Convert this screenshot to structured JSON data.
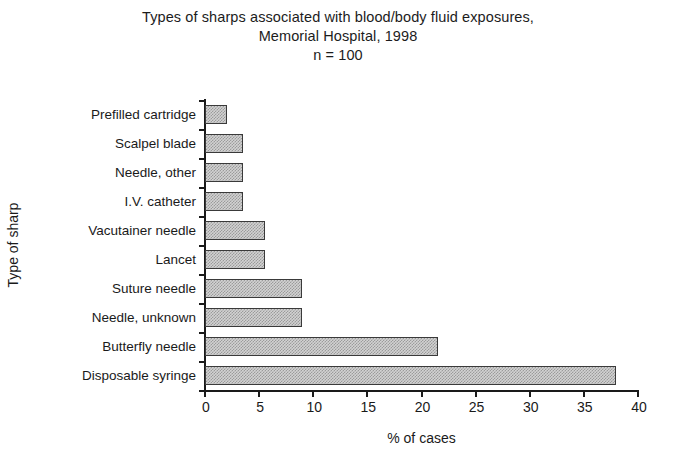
{
  "title": {
    "line1": "Types of sharps associated with blood/body fluid exposures,",
    "line2": "Memorial Hospital, 1998",
    "line3": "n = 100"
  },
  "axis": {
    "x_title": "% of cases",
    "y_title": "Type of sharp"
  },
  "chart_data": {
    "type": "bar",
    "orientation": "horizontal",
    "title": "Types of sharps associated with blood/body fluid exposures, Memorial Hospital, 1998",
    "subtitle": "n = 100",
    "xlabel": "% of cases",
    "ylabel": "Type of sharp",
    "xlim": [
      0,
      40
    ],
    "xticks": [
      0,
      5,
      10,
      15,
      20,
      25,
      30,
      35,
      40
    ],
    "grid": false,
    "legend": false,
    "bar_facecolor": "#d2d2d2",
    "bar_edgecolor": "#3a3a3a",
    "categories": [
      "Prefilled cartridge",
      "Scalpel blade",
      "Needle, other",
      "I.V. catheter",
      "Vacutainer needle",
      "Lancet",
      "Suture needle",
      "Needle, unknown",
      "Butterfly needle",
      "Disposable syringe"
    ],
    "values": [
      2,
      3.5,
      3.5,
      3.5,
      5.5,
      5.5,
      9,
      9,
      21.5,
      38
    ]
  }
}
